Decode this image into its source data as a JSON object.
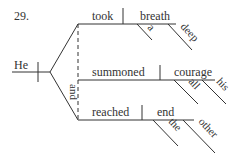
{
  "diagram": {
    "type": "sentence-diagram",
    "number": "29.",
    "subject": "He",
    "conjunction": "and",
    "predicates": [
      {
        "verb": "took",
        "object": "breath",
        "modifiers": [
          "a",
          "deep"
        ]
      },
      {
        "verb": "summoned",
        "object": "courage",
        "modifiers": [
          "all",
          "his"
        ]
      },
      {
        "verb": "reached",
        "object": "end",
        "modifiers": [
          "the",
          "other"
        ]
      }
    ],
    "colors": {
      "ink": "#333333",
      "background": "#ffffff"
    }
  }
}
